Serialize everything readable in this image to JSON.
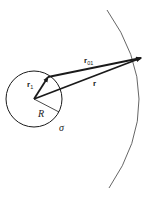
{
  "diagram": {
    "colors": {
      "stroke": "#1a1a1a",
      "arc": "#555555",
      "background": "#ffffff"
    },
    "sphere": {
      "center": [
        34,
        99
      ],
      "radius": 28,
      "radius_label": "R",
      "surface_label": "σ"
    },
    "vectors": [
      {
        "name": "r1",
        "label": "r",
        "subscript": "1",
        "from": [
          34,
          99
        ],
        "to": [
          48,
          77
        ]
      },
      {
        "name": "r01",
        "label": "r",
        "subscript": "01",
        "from": [
          48,
          77
        ],
        "to": [
          141,
          58
        ]
      },
      {
        "name": "r",
        "label": "r",
        "subscript": "",
        "from": [
          34,
          99
        ],
        "to": [
          141,
          58
        ]
      }
    ],
    "outer_arc": {
      "start": [
        107,
        10
      ],
      "end": [
        109,
        188
      ]
    }
  }
}
